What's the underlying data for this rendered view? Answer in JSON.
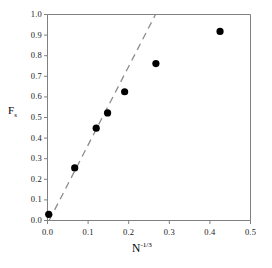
{
  "chart_data": {
    "type": "scatter",
    "title": "",
    "subtitle": "",
    "xlabel": "N",
    "xlabel_superscript": "-1/3",
    "ylabel": "F",
    "ylabel_subscript": "s",
    "xlim": [
      0.0,
      0.5
    ],
    "ylim": [
      0.0,
      1.0
    ],
    "xticks": [
      "0.0",
      "0.1",
      "0.2",
      "0.3",
      "0.4",
      "0.5"
    ],
    "xtick_values": [
      0.0,
      0.1,
      0.2,
      0.3,
      0.4,
      0.5
    ],
    "yticks": [
      "0.0",
      "0.1",
      "0.2",
      "0.3",
      "0.4",
      "0.5",
      "0.6",
      "0.7",
      "0.8",
      "0.9",
      "1.0"
    ],
    "ytick_values": [
      0.0,
      0.1,
      0.2,
      0.3,
      0.4,
      0.5,
      0.6,
      0.7,
      0.8,
      0.9,
      1.0
    ],
    "grid": false,
    "legend": "none",
    "marker_color": "#000000",
    "marker_style": "filled-circle",
    "axis_color": "#808080",
    "series": [
      {
        "name": "data",
        "type": "scatter",
        "points": [
          {
            "x": 0.003,
            "y": 0.03
          },
          {
            "x": 0.067,
            "y": 0.255
          },
          {
            "x": 0.12,
            "y": 0.448
          },
          {
            "x": 0.148,
            "y": 0.522
          },
          {
            "x": 0.19,
            "y": 0.625
          },
          {
            "x": 0.267,
            "y": 0.762
          },
          {
            "x": 0.425,
            "y": 0.918
          }
        ]
      },
      {
        "name": "reference-line",
        "type": "line",
        "style": "dashed",
        "color": "#8c8c8c",
        "x_start": 0.004,
        "y_start": 0.0,
        "x_end": 0.266,
        "y_end": 1.0
      }
    ]
  }
}
